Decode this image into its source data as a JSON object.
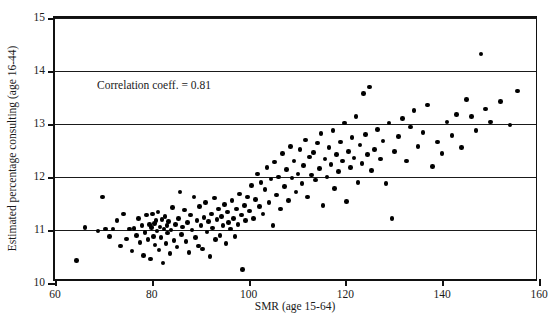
{
  "chart_data": {
    "type": "scatter",
    "title": "",
    "xlabel": "SMR (age 15-64)",
    "ylabel": "Estimated percentage consulting (age 16-44)",
    "xlim": [
      60,
      160
    ],
    "ylim": [
      10,
      15
    ],
    "xticks": [
      60,
      80,
      100,
      120,
      140,
      160
    ],
    "yticks": [
      10,
      11,
      12,
      13,
      14,
      15
    ],
    "grid": "horizontal",
    "gridlines_y": [
      11,
      12,
      13,
      14,
      15
    ],
    "legend": "none",
    "annotations": [
      {
        "text": "Correlation coeff. = 0.81",
        "x": 68,
        "y": 13.68
      }
    ],
    "marker": {
      "shape": "circle",
      "color": "#000000",
      "size": 4.6
    },
    "series": [
      {
        "name": "practices",
        "points": [
          [
            64.5,
            10.42
          ],
          [
            66.2,
            11.05
          ],
          [
            68.9,
            10.98
          ],
          [
            69.8,
            11.62
          ],
          [
            70.4,
            11.02
          ],
          [
            71.3,
            10.88
          ],
          [
            72.0,
            11.02
          ],
          [
            72.8,
            11.18
          ],
          [
            73.5,
            10.7
          ],
          [
            74.2,
            11.3
          ],
          [
            74.8,
            10.83
          ],
          [
            75.4,
            11.02
          ],
          [
            75.9,
            10.6
          ],
          [
            76.3,
            11.03
          ],
          [
            76.8,
            10.9
          ],
          [
            77.2,
            11.22
          ],
          [
            77.6,
            10.76
          ],
          [
            78.0,
            11.08
          ],
          [
            78.3,
            10.52
          ],
          [
            78.6,
            10.95
          ],
          [
            78.9,
            11.28
          ],
          [
            79.2,
            10.82
          ],
          [
            79.5,
            11.1
          ],
          [
            79.7,
            10.45
          ],
          [
            79.9,
            11.05
          ],
          [
            80.1,
            11.3
          ],
          [
            80.3,
            10.88
          ],
          [
            80.5,
            11.12
          ],
          [
            80.7,
            10.72
          ],
          [
            80.9,
            11.18
          ],
          [
            81.1,
            10.98
          ],
          [
            81.3,
            11.34
          ],
          [
            81.5,
            10.62
          ],
          [
            81.7,
            11.06
          ],
          [
            81.9,
            10.86
          ],
          [
            82.1,
            11.2
          ],
          [
            82.3,
            10.38
          ],
          [
            82.5,
            11.02
          ],
          [
            82.7,
            11.26
          ],
          [
            82.9,
            10.74
          ],
          [
            83.1,
            11.08
          ],
          [
            83.3,
            10.94
          ],
          [
            83.5,
            11.16
          ],
          [
            83.8,
            10.56
          ],
          [
            84.0,
            11.0
          ],
          [
            84.3,
            11.42
          ],
          [
            84.6,
            10.8
          ],
          [
            84.9,
            11.1
          ],
          [
            85.2,
            10.68
          ],
          [
            85.5,
            11.22
          ],
          [
            85.8,
            11.72
          ],
          [
            86.1,
            10.92
          ],
          [
            86.4,
            11.06
          ],
          [
            86.8,
            11.38
          ],
          [
            87.1,
            10.78
          ],
          [
            87.4,
            11.14
          ],
          [
            87.7,
            10.58
          ],
          [
            88.0,
            11.28
          ],
          [
            88.3,
            11.0
          ],
          [
            88.7,
            11.62
          ],
          [
            89.0,
            10.86
          ],
          [
            89.3,
            11.18
          ],
          [
            89.6,
            10.7
          ],
          [
            89.9,
            11.44
          ],
          [
            90.2,
            11.08
          ],
          [
            90.5,
            10.64
          ],
          [
            90.8,
            11.24
          ],
          [
            91.1,
            11.52
          ],
          [
            91.4,
            10.96
          ],
          [
            91.7,
            11.16
          ],
          [
            92.0,
            10.5
          ],
          [
            92.3,
            11.3
          ],
          [
            92.6,
            11.04
          ],
          [
            92.9,
            11.6
          ],
          [
            93.2,
            10.82
          ],
          [
            93.5,
            11.2
          ],
          [
            93.8,
            11.4
          ],
          [
            94.1,
            10.9
          ],
          [
            94.4,
            11.26
          ],
          [
            94.7,
            11.08
          ],
          [
            95.0,
            11.48
          ],
          [
            95.3,
            10.74
          ],
          [
            95.6,
            11.34
          ],
          [
            95.9,
            11.14
          ],
          [
            96.2,
            11.02
          ],
          [
            96.6,
            11.56
          ],
          [
            96.9,
            11.22
          ],
          [
            97.2,
            10.88
          ],
          [
            97.5,
            11.4
          ],
          [
            97.8,
            11.1
          ],
          [
            98.1,
            11.68
          ],
          [
            98.5,
            11.28
          ],
          [
            98.8,
            10.26
          ],
          [
            99.1,
            11.46
          ],
          [
            99.4,
            11.18
          ],
          [
            99.8,
            11.62
          ],
          [
            100.2,
            11.36
          ],
          [
            100.6,
            11.84
          ],
          [
            101.0,
            11.22
          ],
          [
            101.4,
            11.58
          ],
          [
            101.8,
            12.06
          ],
          [
            102.2,
            11.44
          ],
          [
            102.6,
            11.9
          ],
          [
            103.0,
            11.3
          ],
          [
            103.4,
            11.76
          ],
          [
            103.8,
            12.18
          ],
          [
            104.2,
            11.52
          ],
          [
            104.6,
            11.96
          ],
          [
            105.0,
            11.08
          ],
          [
            105.4,
            12.28
          ],
          [
            105.8,
            11.66
          ],
          [
            106.2,
            12.0
          ],
          [
            106.6,
            11.4
          ],
          [
            107.0,
            12.44
          ],
          [
            107.4,
            11.82
          ],
          [
            107.8,
            12.14
          ],
          [
            108.2,
            11.56
          ],
          [
            108.6,
            12.58
          ],
          [
            109.0,
            11.98
          ],
          [
            109.4,
            12.3
          ],
          [
            109.8,
            11.72
          ],
          [
            110.2,
            12.06
          ],
          [
            110.6,
            12.52
          ],
          [
            111.0,
            11.88
          ],
          [
            111.4,
            12.22
          ],
          [
            111.8,
            12.7
          ],
          [
            112.2,
            11.62
          ],
          [
            112.6,
            12.38
          ],
          [
            113.0,
            12.04
          ],
          [
            113.4,
            12.46
          ],
          [
            113.8,
            11.94
          ],
          [
            114.2,
            12.64
          ],
          [
            114.6,
            12.16
          ],
          [
            115.0,
            12.82
          ],
          [
            115.4,
            11.46
          ],
          [
            115.8,
            12.34
          ],
          [
            116.2,
            12.0
          ],
          [
            116.6,
            12.56
          ],
          [
            117.0,
            12.24
          ],
          [
            117.4,
            12.88
          ],
          [
            117.8,
            11.78
          ],
          [
            118.2,
            12.42
          ],
          [
            118.6,
            12.1
          ],
          [
            119.0,
            12.66
          ],
          [
            119.4,
            12.3
          ],
          [
            119.8,
            13.02
          ],
          [
            120.2,
            11.54
          ],
          [
            120.6,
            12.48
          ],
          [
            121.0,
            12.18
          ],
          [
            121.4,
            12.74
          ],
          [
            121.8,
            12.36
          ],
          [
            122.2,
            13.14
          ],
          [
            122.6,
            11.9
          ],
          [
            123.0,
            12.6
          ],
          [
            123.4,
            12.26
          ],
          [
            123.8,
            13.58
          ],
          [
            124.2,
            12.8
          ],
          [
            124.6,
            12.42
          ],
          [
            125.0,
            13.7
          ],
          [
            125.4,
            12.12
          ],
          [
            126.0,
            12.52
          ],
          [
            126.6,
            12.9
          ],
          [
            127.2,
            12.34
          ],
          [
            127.8,
            12.68
          ],
          [
            128.4,
            11.88
          ],
          [
            129.0,
            13.02
          ],
          [
            129.6,
            11.22
          ],
          [
            130.2,
            12.48
          ],
          [
            131.0,
            12.76
          ],
          [
            131.8,
            13.1
          ],
          [
            132.6,
            12.3
          ],
          [
            133.4,
            12.94
          ],
          [
            134.2,
            13.26
          ],
          [
            135.0,
            12.58
          ],
          [
            136.0,
            12.84
          ],
          [
            137.0,
            13.36
          ],
          [
            138.0,
            12.2
          ],
          [
            139.0,
            12.66
          ],
          [
            140.0,
            12.44
          ],
          [
            141.0,
            13.04
          ],
          [
            142.0,
            12.78
          ],
          [
            143.0,
            13.18
          ],
          [
            144.0,
            12.56
          ],
          [
            145.0,
            13.46
          ],
          [
            146.0,
            13.14
          ],
          [
            147.0,
            12.88
          ],
          [
            148.0,
            14.32
          ],
          [
            149.0,
            13.28
          ],
          [
            150.0,
            13.04
          ],
          [
            152.0,
            13.42
          ],
          [
            154.0,
            12.98
          ],
          [
            155.5,
            13.62
          ]
        ]
      }
    ]
  }
}
